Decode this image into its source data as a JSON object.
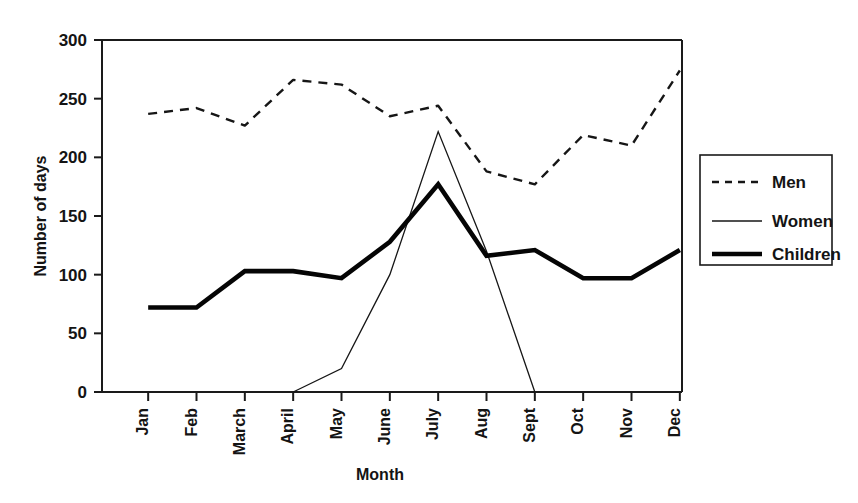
{
  "chart_data": {
    "type": "line",
    "title": "",
    "xlabel": "Month",
    "ylabel": "Number of days",
    "categories": [
      "Jan",
      "Feb",
      "March",
      "April",
      "May",
      "June",
      "July",
      "Aug",
      "Sept",
      "Oct",
      "Nov",
      "Dec"
    ],
    "series": [
      {
        "name": "Men",
        "style": "dashed",
        "values": [
          237,
          242,
          227,
          266,
          262,
          235,
          244,
          188,
          177,
          219,
          210,
          274
        ]
      },
      {
        "name": "Women",
        "style": "thin-solid",
        "values": [
          null,
          null,
          null,
          0,
          20,
          100,
          222,
          120,
          0,
          null,
          null,
          null
        ]
      },
      {
        "name": "Children",
        "style": "thick-solid",
        "values": [
          72,
          72,
          103,
          103,
          97,
          128,
          177,
          116,
          121,
          97,
          97,
          121
        ]
      }
    ],
    "ylim": [
      0,
      300
    ],
    "yticks": [
      0,
      50,
      100,
      150,
      200,
      250,
      300
    ],
    "grid": false,
    "legend_position": "right-outside",
    "legend_entries": [
      "Men",
      "Women",
      "Children"
    ]
  },
  "axes": {
    "y_title": "Number of days",
    "x_title": "Month",
    "y_tick_labels": [
      "0",
      "50",
      "100",
      "150",
      "200",
      "250",
      "300"
    ],
    "x_tick_labels": [
      "Jan",
      "Feb",
      "March",
      "April",
      "May",
      "June",
      "July",
      "Aug",
      "Sept",
      "Oct",
      "Nov",
      "Dec"
    ]
  },
  "legend": {
    "items": [
      {
        "label": "Men",
        "style": "dashed"
      },
      {
        "label": "Women",
        "style": "thin-solid"
      },
      {
        "label": "Children",
        "style": "thick-solid"
      }
    ]
  },
  "colors": {
    "ink": "#141414",
    "background": "#ffffff"
  }
}
